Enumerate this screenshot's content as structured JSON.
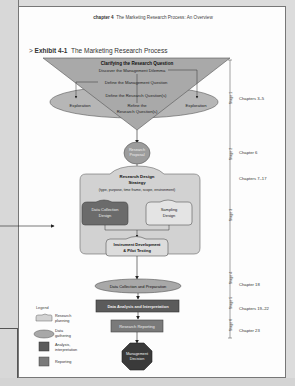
{
  "running_head": {
    "chapter": "chapter 4",
    "title": "The Marketing Research Process: An Overview"
  },
  "exhibit": {
    "number": "Exhibit 4-1",
    "title": "The Marketing Research Process"
  },
  "clarifying": {
    "title": "Clarifying the Research Question",
    "steps": [
      "Discover the Management Dilemma",
      "Define the Management Question",
      "Define the Research Question(s)",
      "Refine the",
      "Research Question(s)"
    ],
    "left_oval": "Exploration",
    "right_oval": "Exploration"
  },
  "research_proposal": [
    "Research",
    "Proposal"
  ],
  "design": {
    "title_line1": "Research Design",
    "title_line2": "Strategy",
    "subtitle": "(type, purpose, time frame, scope, environment)",
    "data_collection": [
      "Data Collection",
      "Design"
    ],
    "sampling": [
      "Sampling",
      "Design"
    ],
    "instrument": [
      "Instrument Development",
      "& Pilot Testing"
    ]
  },
  "data_collection_prep": "Data Collection and Preparation",
  "data_analysis": "Data Analysis and Interpretation",
  "reporting": "Research Reporting",
  "decision": [
    "Management",
    "Decision"
  ],
  "stages": [
    "Stage 1",
    "Stage 2",
    "Stage 3",
    "Stage 4",
    "Stage 5",
    "Stage 6"
  ],
  "chapters": [
    "Chapters 3–5",
    "Chapter 6",
    "Chapters 7–17",
    "Chapter 18",
    "Chapters 19–22",
    "Chapter 23"
  ],
  "legend": {
    "title": "Legend",
    "items": [
      {
        "label1": "Research",
        "label2": "planning"
      },
      {
        "label1": "Data",
        "label2": "gathering"
      },
      {
        "label1": "Analysis,",
        "label2": "interpretation"
      },
      {
        "label1": "Reporting",
        "label2": ""
      }
    ]
  },
  "colors": {
    "planning": "#c9c9c9",
    "gathering": "#a3a3a3",
    "data_collection_design": "#6b6b6b",
    "analysis": "#5b5b5b",
    "reporting": "#7a7a7a",
    "decision": "#3a3a3a",
    "triangle": "#a9a9a9"
  }
}
